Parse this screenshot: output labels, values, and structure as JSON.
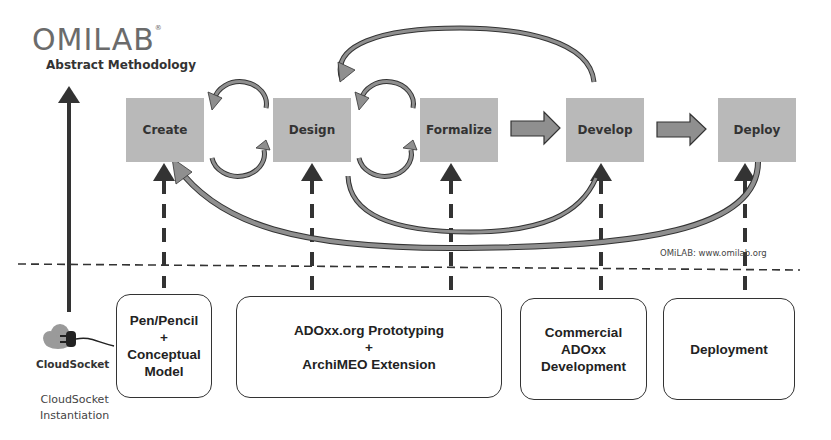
{
  "header": {
    "logo": "OMILAB",
    "logo_mark": "®",
    "subtitle": "Abstract Methodology"
  },
  "phases": [
    {
      "label": "Create"
    },
    {
      "label": "Design"
    },
    {
      "label": "Formalize"
    },
    {
      "label": "Develop"
    },
    {
      "label": "Deploy"
    }
  ],
  "tools": [
    {
      "lines": [
        "Pen/Pencil",
        "+",
        "Conceptual",
        "Model"
      ]
    },
    {
      "lines": [
        "ADOxx.org Prototyping",
        "+",
        "ArchiMEO Extension"
      ]
    },
    {
      "lines": [
        "Commercial",
        "ADOxx",
        "Development"
      ]
    },
    {
      "lines": [
        "Deployment"
      ]
    }
  ],
  "credit": "OMiLAB: www.omilab.org",
  "cloudsocket": {
    "logo_text": "CloudSocket",
    "caption_line1": "CloudSocket",
    "caption_line2": "Instantiation"
  },
  "colors": {
    "phase_fill": "#b9b9b9",
    "arrow_fill": "#8f8f8f",
    "arrow_stroke": "#333333",
    "dark": "#333333"
  }
}
